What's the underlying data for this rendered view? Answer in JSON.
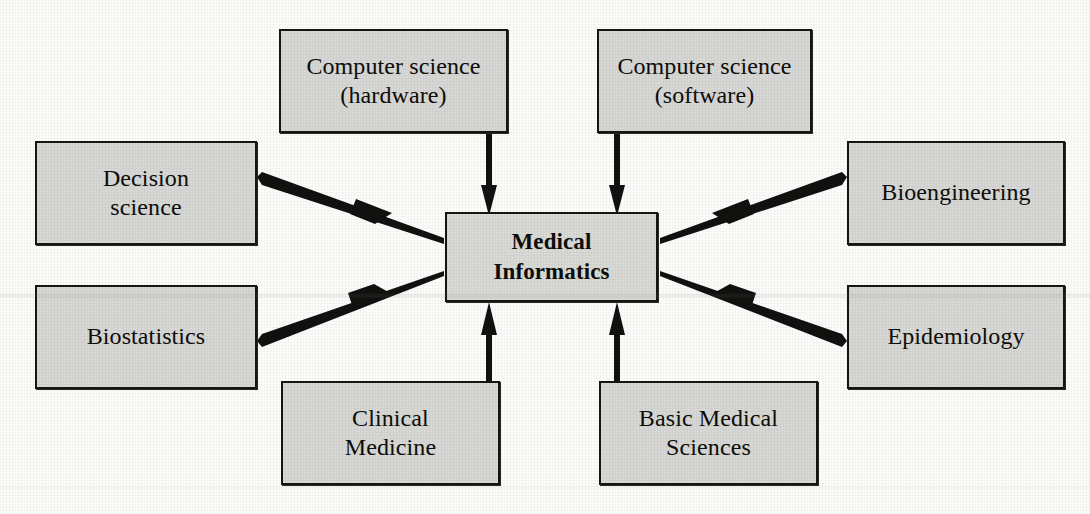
{
  "diagram": {
    "type": "hub-and-spoke concept diagram",
    "colors": {
      "box_fill": "#d8d8d6",
      "box_border": "#16150f",
      "arrow": "#111110",
      "background": "#fdfdfc",
      "text": "#0d0d09"
    },
    "center": {
      "id": "medical-informatics",
      "label": "Medical\nInformatics",
      "bold": true,
      "x": 445,
      "y": 212,
      "width": 213,
      "height": 90
    },
    "nodes": [
      {
        "id": "computer-science-hardware",
        "label": "Computer science\n(hardware)",
        "x": 279,
        "y": 29,
        "width": 229,
        "height": 104,
        "arrow_direction": "down"
      },
      {
        "id": "computer-science-software",
        "label": "Computer science\n(software)",
        "x": 597,
        "y": 29,
        "width": 215,
        "height": 104,
        "arrow_direction": "down"
      },
      {
        "id": "decision-science",
        "label": "Decision\nscience",
        "x": 35,
        "y": 141,
        "width": 222,
        "height": 104,
        "arrow_direction": "down-right"
      },
      {
        "id": "bioengineering",
        "label": "Bioengineering",
        "x": 847,
        "y": 141,
        "width": 218,
        "height": 104,
        "arrow_direction": "down-left"
      },
      {
        "id": "biostatistics",
        "label": "Biostatistics",
        "x": 35,
        "y": 285,
        "width": 222,
        "height": 104,
        "arrow_direction": "up-right"
      },
      {
        "id": "epidemiology",
        "label": "Epidemiology",
        "x": 847,
        "y": 285,
        "width": 218,
        "height": 104,
        "arrow_direction": "up-left"
      },
      {
        "id": "clinical-medicine",
        "label": "Clinical\nMedicine",
        "x": 281,
        "y": 381,
        "width": 219,
        "height": 104,
        "arrow_direction": "up"
      },
      {
        "id": "basic-medical-sciences",
        "label": "Basic Medical\nSciences",
        "x": 599,
        "y": 381,
        "width": 219,
        "height": 104,
        "arrow_direction": "up"
      },
      {
        "id": "epidemiology-bottom",
        "label": "",
        "x": 0,
        "y": 0,
        "width": 0,
        "height": 0,
        "arrow_direction": "none"
      }
    ],
    "edges": [
      {
        "from": "computer-science-hardware",
        "to": "medical-informatics",
        "style": "tapered-arrow"
      },
      {
        "from": "computer-science-software",
        "to": "medical-informatics",
        "style": "tapered-arrow"
      },
      {
        "from": "decision-science",
        "to": "medical-informatics",
        "style": "tapered-arrow"
      },
      {
        "from": "bioengineering",
        "to": "medical-informatics",
        "style": "tapered-arrow"
      },
      {
        "from": "biostatistics",
        "to": "medical-informatics",
        "style": "tapered-arrow"
      },
      {
        "from": "epidemiology",
        "to": "medical-informatics",
        "style": "tapered-arrow"
      },
      {
        "from": "clinical-medicine",
        "to": "medical-informatics",
        "style": "tapered-arrow"
      },
      {
        "from": "basic-medical-sciences",
        "to": "medical-informatics",
        "style": "tapered-arrow"
      }
    ]
  }
}
